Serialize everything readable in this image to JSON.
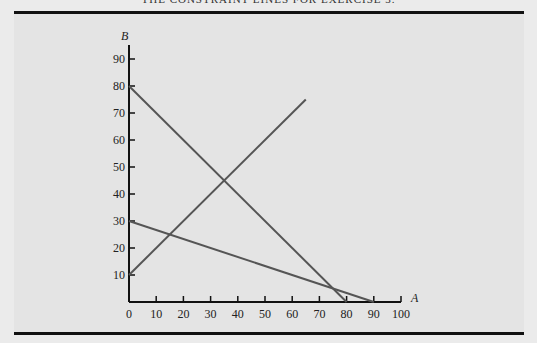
{
  "header": {
    "title": "THE CONSTRAINT LINES FOR EXERCISE 3."
  },
  "chart_data": {
    "type": "line",
    "title": "",
    "xlabel": "A",
    "ylabel": "B",
    "xlim": [
      0,
      100
    ],
    "ylim": [
      0,
      95
    ],
    "x_ticks": [
      0,
      10,
      20,
      30,
      40,
      50,
      60,
      70,
      80,
      90,
      100
    ],
    "y_ticks": [
      10,
      20,
      30,
      40,
      50,
      60,
      70,
      80,
      90
    ],
    "grid": false,
    "legend": null,
    "series": [
      {
        "name": "line-1",
        "points": [
          [
            0,
            80
          ],
          [
            80,
            0
          ]
        ]
      },
      {
        "name": "line-2",
        "points": [
          [
            0,
            30
          ],
          [
            90,
            0
          ]
        ]
      },
      {
        "name": "line-3",
        "points": [
          [
            0,
            10
          ],
          [
            65,
            75
          ]
        ]
      }
    ],
    "line_color": "#555555"
  }
}
